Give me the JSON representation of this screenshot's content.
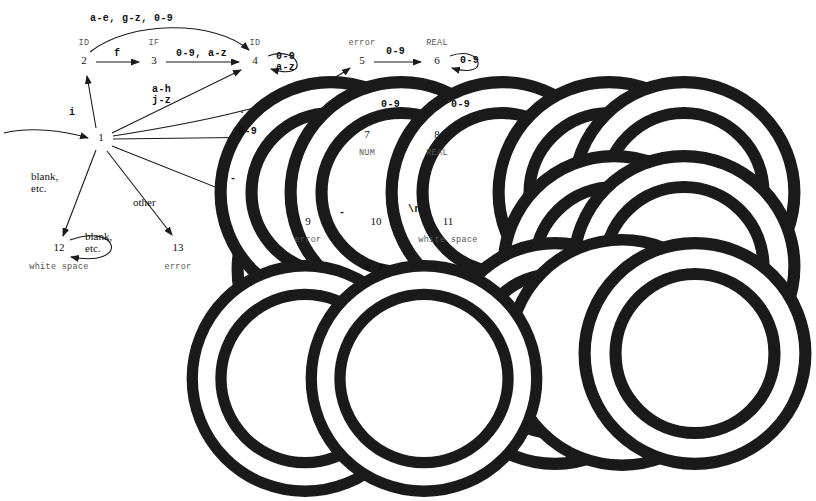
{
  "diagram": {
    "states": [
      {
        "id": "1",
        "num": "1",
        "accepting": false,
        "caption": "",
        "caption_pos": "none",
        "cx": 101,
        "cy": 139,
        "r": 10
      },
      {
        "id": "2",
        "num": "2",
        "accepting": true,
        "caption": "ID",
        "caption_pos": "above",
        "cx": 84,
        "cy": 62,
        "r": 10
      },
      {
        "id": "3",
        "num": "3",
        "accepting": true,
        "caption": "IF",
        "caption_pos": "above",
        "cx": 154,
        "cy": 62,
        "r": 10
      },
      {
        "id": "4",
        "num": "4",
        "accepting": true,
        "caption": "ID",
        "caption_pos": "above",
        "cx": 255,
        "cy": 62,
        "r": 10
      },
      {
        "id": "5",
        "num": "5",
        "accepting": true,
        "caption": "error",
        "caption_pos": "above",
        "cx": 362,
        "cy": 62,
        "r": 10
      },
      {
        "id": "6",
        "num": "6",
        "accepting": true,
        "caption": "REAL",
        "caption_pos": "above",
        "cx": 437,
        "cy": 62,
        "r": 10
      },
      {
        "id": "7",
        "num": "7",
        "accepting": true,
        "caption": "NUM",
        "caption_pos": "below",
        "cx": 367,
        "cy": 136,
        "r": 10
      },
      {
        "id": "8",
        "num": "8",
        "accepting": true,
        "caption": "REAL",
        "caption_pos": "below",
        "cx": 437,
        "cy": 136,
        "r": 10
      },
      {
        "id": "9",
        "num": "9",
        "accepting": true,
        "caption": "error",
        "caption_pos": "below",
        "cx": 308,
        "cy": 223,
        "r": 10
      },
      {
        "id": "10",
        "num": "10",
        "accepting": false,
        "caption": "",
        "caption_pos": "none",
        "cx": 376,
        "cy": 223,
        "r": 11
      },
      {
        "id": "11",
        "num": "11",
        "accepting": true,
        "caption": "white space",
        "caption_pos": "below",
        "cx": 448,
        "cy": 223,
        "r": 10
      },
      {
        "id": "12",
        "num": "12",
        "accepting": true,
        "caption": "white space",
        "caption_pos": "below",
        "cx": 59,
        "cy": 249,
        "r": 11
      },
      {
        "id": "13",
        "num": "13",
        "accepting": true,
        "caption": "error",
        "caption_pos": "below",
        "cx": 178,
        "cy": 249,
        "r": 11
      }
    ],
    "edge_labels": [
      {
        "name": "label-2-to-4-top",
        "text": "a-e, g-z, 0-9",
        "x": 90,
        "y": 14,
        "style": "mono"
      },
      {
        "name": "label-2-to-3",
        "text": "f",
        "x": 114,
        "y": 49,
        "style": "mono"
      },
      {
        "name": "label-3-to-4",
        "text": "0-9, a-z",
        "x": 176,
        "y": 49,
        "style": "mono"
      },
      {
        "name": "label-4-selfloop",
        "text": "0-9\na-z",
        "x": 276,
        "y": 52,
        "style": "mono"
      },
      {
        "name": "label-5-to-6",
        "text": "0-9",
        "x": 386,
        "y": 47,
        "style": "mono"
      },
      {
        "name": "label-6-selfloop",
        "text": "0-9",
        "x": 460,
        "y": 56,
        "style": "mono"
      },
      {
        "name": "label-7-selfloop",
        "text": "0-9",
        "x": 381,
        "y": 100,
        "style": "mono"
      },
      {
        "name": "label-8-selfloop",
        "text": "0-9",
        "x": 451,
        "y": 100,
        "style": "mono"
      },
      {
        "name": "label-7-to-8",
        "text": ".",
        "x": 400,
        "y": 128,
        "style": "mono"
      },
      {
        "name": "label-1-to-4",
        "text": "a-h\nj-z",
        "x": 152,
        "y": 85,
        "style": "mono"
      },
      {
        "name": "label-1-to-5",
        "text": ".",
        "x": 239,
        "y": 106,
        "style": "mono"
      },
      {
        "name": "label-1-to-7",
        "text": "0-9",
        "x": 238,
        "y": 127,
        "style": "mono"
      },
      {
        "name": "label-1-to-2",
        "text": "i",
        "x": 69,
        "y": 108,
        "style": "mono"
      },
      {
        "name": "label-1-to-12",
        "text": "blank,\netc.",
        "x": 31,
        "y": 171,
        "style": "serif"
      },
      {
        "name": "label-12-selfloop",
        "text": "blank,\netc.",
        "x": 85,
        "y": 231,
        "style": "serif"
      },
      {
        "name": "label-1-to-13",
        "text": "other",
        "x": 133,
        "y": 197,
        "style": "serif"
      },
      {
        "name": "label-1-to-9",
        "text": "-",
        "x": 230,
        "y": 174,
        "style": "mono"
      },
      {
        "name": "label-9-to-10",
        "text": "-",
        "x": 339,
        "y": 208,
        "style": "mono"
      },
      {
        "name": "label-10-to-11",
        "text": "\\n",
        "x": 408,
        "y": 205,
        "style": "mono"
      },
      {
        "name": "label-10-selfloop",
        "text": "a-z",
        "x": 365,
        "y": 263,
        "style": "mono"
      }
    ],
    "colors": {
      "stroke": "#1a1a1a",
      "caption": "#555555",
      "background": "#ffffff"
    }
  }
}
